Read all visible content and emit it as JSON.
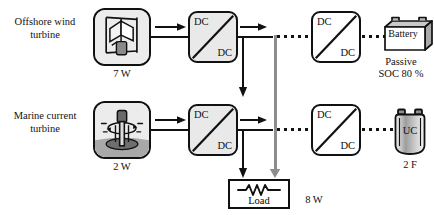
{
  "diagram": {
    "colors": {
      "line": "#111111",
      "bus": "#8d8d8d",
      "icon_box_fill": "#ececec",
      "converter_shaded_fill": "#e9e9e9",
      "background": "#ffffff"
    }
  },
  "sources": [
    {
      "name": "offshore-wind",
      "label": "Offshore wind turbine",
      "icon": "vertical-axis-wind-turbine-icon",
      "rating": "7 W"
    },
    {
      "name": "marine-current",
      "label": "Marine current turbine",
      "icon": "vertical-axis-marine-turbine-icon",
      "rating": "2 W"
    }
  ],
  "converters": [
    {
      "name": "wind-source-converter",
      "top_label": "DC",
      "bottom_label": "DC"
    },
    {
      "name": "battery-stage-converter",
      "top_label": "DC",
      "bottom_label": "DC"
    },
    {
      "name": "marine-source-converter",
      "top_label": "DC",
      "bottom_label": "DC"
    },
    {
      "name": "ultracap-stage-converter",
      "top_label": "DC",
      "bottom_label": "DC"
    }
  ],
  "load": {
    "label": "Load",
    "symbol": "resistor-icon",
    "rating": "8 W"
  },
  "storage": [
    {
      "name": "battery",
      "label": "Battery",
      "icon": "battery-icon",
      "mode": "Passive",
      "state_of_charge": "SOC 80 %"
    },
    {
      "name": "ultracapacitor",
      "label": "UC",
      "icon": "ultracapacitor-icon",
      "capacitance": "2 F"
    }
  ]
}
